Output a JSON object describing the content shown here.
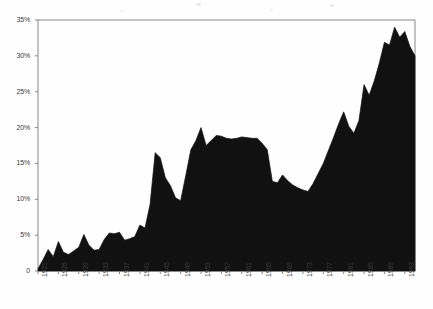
{
  "chart_data": {
    "type": "area",
    "title": "",
    "subtitle": "",
    "xlabel": "",
    "ylabel": "",
    "xlim": [
      1921,
      1995
    ],
    "ylim": [
      0,
      35
    ],
    "grid": false,
    "legend": null,
    "series_color": "#111111",
    "background": "#ffffff",
    "frame_color": "#888888",
    "y_ticks": [
      0,
      5,
      10,
      15,
      20,
      25,
      30,
      35
    ],
    "y_tick_labels": [
      "0",
      "5%",
      "10%",
      "15%",
      "20%",
      "25%",
      "30%",
      "35%"
    ],
    "x_tick_labels": [
      "1921",
      "1925",
      "1929",
      "1933",
      "1937",
      "1941",
      "1945",
      "1949",
      "1953",
      "1957",
      "1961",
      "1965",
      "1969",
      "1973",
      "1977",
      "1981",
      "1985",
      "1989",
      "1993"
    ],
    "x": [
      1921,
      1922,
      1923,
      1924,
      1925,
      1926,
      1927,
      1928,
      1929,
      1930,
      1931,
      1932,
      1933,
      1934,
      1935,
      1936,
      1937,
      1938,
      1939,
      1940,
      1941,
      1942,
      1943,
      1944,
      1945,
      1946,
      1947,
      1948,
      1949,
      1950,
      1951,
      1952,
      1953,
      1954,
      1955,
      1956,
      1957,
      1958,
      1959,
      1960,
      1961,
      1962,
      1963,
      1964,
      1965,
      1966,
      1967,
      1968,
      1969,
      1970,
      1971,
      1972,
      1973,
      1974,
      1975,
      1976,
      1977,
      1978,
      1979,
      1980,
      1981,
      1982,
      1983,
      1984,
      1985,
      1986,
      1987,
      1988,
      1989,
      1990,
      1991,
      1992,
      1993,
      1994,
      1995
    ],
    "values": [
      0.3,
      1.6,
      3.0,
      2.0,
      4.1,
      2.6,
      2.3,
      2.8,
      3.3,
      5.1,
      3.6,
      2.9,
      3.0,
      4.4,
      5.3,
      5.2,
      5.4,
      4.3,
      4.5,
      4.8,
      6.4,
      6.0,
      9.3,
      16.5,
      15.8,
      13.0,
      11.9,
      10.2,
      9.8,
      13.3,
      16.9,
      18.2,
      20.0,
      17.5,
      18.2,
      18.9,
      18.8,
      18.5,
      18.4,
      18.5,
      18.7,
      18.6,
      18.5,
      18.5,
      17.8,
      16.9,
      12.5,
      12.3,
      13.4,
      12.6,
      12.0,
      11.6,
      11.3,
      11.1,
      12.2,
      13.6,
      15.0,
      16.8,
      18.6,
      20.5,
      22.2,
      20.2,
      19.2,
      21.0,
      26.0,
      24.5,
      26.5,
      29.0,
      31.9,
      31.5,
      34.0,
      32.6,
      33.4,
      31.3,
      30.0
    ],
    "max_value": 34.0,
    "max_year": 1991,
    "min_value": 0.3,
    "min_year": 1921,
    "final_value": 30.0
  }
}
